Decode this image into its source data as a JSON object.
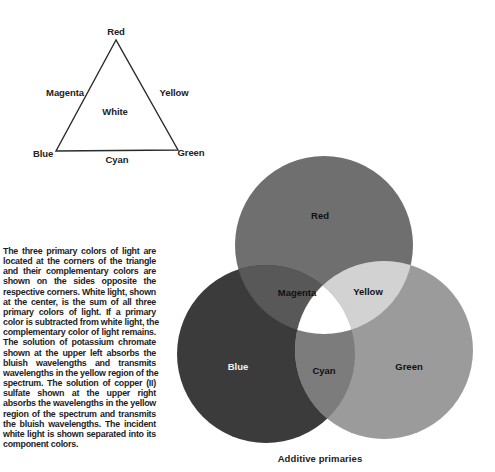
{
  "triangle": {
    "vertices": {
      "top": "Red",
      "bottom_left": "Blue",
      "bottom_right": "Green"
    },
    "sides": {
      "left": "Magenta",
      "right": "Yellow",
      "bottom": "Cyan"
    },
    "center": "White"
  },
  "description": {
    "lines": [
      "The three primary colors of light are",
      "located at the corners of the triangle",
      "and their complementary colors are",
      "shown on the sides opposite the",
      "respective corners. White light, shown",
      "at the center, is the sum of all three",
      "primary colors of light. If a primary",
      "color is subtracted from white light, the",
      "complementary color of light remains.",
      "The solution of potassium chromate",
      "shown at the upper left absorbs the",
      "bluish wavelengths and transmits",
      "wavelengths in the yellow region of the",
      "spectrum. The solution of copper (II)",
      "sulfate shown at the upper right",
      "absorbs the wavelengths in the yellow",
      "region of the spectrum and transmits",
      "the bluish wavelengths. The incident",
      "white light is shown separated into its",
      "component colors."
    ]
  },
  "venn": {
    "circles": {
      "red": "Red",
      "blue": "Blue",
      "green": "Green"
    },
    "overlaps": {
      "red_blue": "Magenta",
      "red_green": "Yellow",
      "blue_green": "Cyan",
      "all": ""
    },
    "caption": "Additive primaries",
    "shades": {
      "red": "#6f6f6f",
      "blue": "#3b3b3b",
      "green": "#9b9b9b",
      "magenta": "#585858",
      "yellow": "#d2d2d2",
      "cyan": "#7c7c7c",
      "white": "#ffffff"
    }
  }
}
